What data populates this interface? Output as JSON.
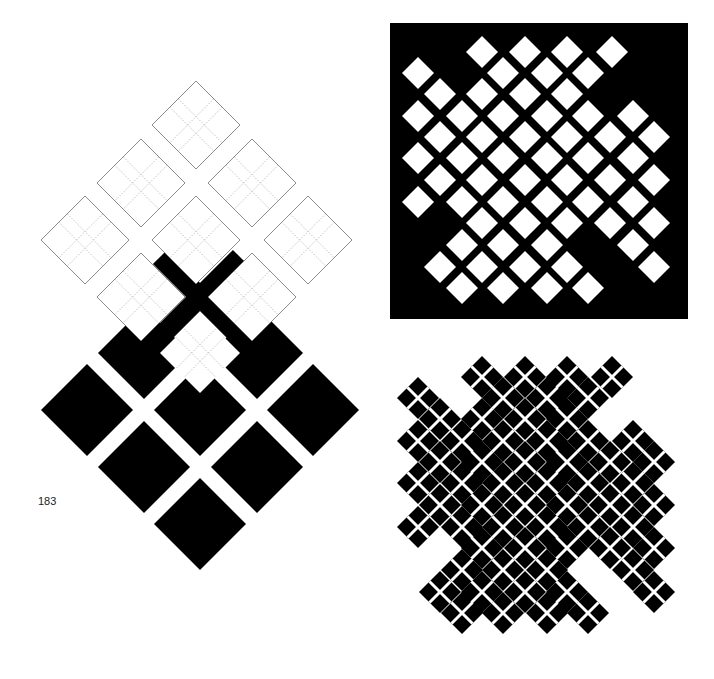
{
  "page": {
    "number": "183",
    "background": "#ffffff",
    "ink": "#000000"
  },
  "figure_left": {
    "description": "Grid of outlined diamonds with dotted inner crosses above a grid of solid black diamonds",
    "outline_diamonds": {
      "half_diagonal": 44,
      "stroke": "#6e6e6e",
      "dotted_stroke": "#9a9a9a",
      "centers": [
        [
          196,
          125
        ],
        [
          141,
          183
        ],
        [
          252,
          183
        ],
        [
          85,
          240
        ],
        [
          196,
          240
        ],
        [
          308,
          240
        ],
        [
          141,
          297
        ],
        [
          252,
          297
        ]
      ]
    },
    "center_white_diamond": {
      "center": [
        200,
        353
      ],
      "half_diagonal": 40
    },
    "black_x": {
      "center": [
        200,
        297
      ],
      "arm_half_length": 40,
      "arm_width": 20
    },
    "black_diamonds": {
      "half_diagonal": 46,
      "centers": [
        [
          144,
          353
        ],
        [
          257,
          353
        ],
        [
          87,
          410
        ],
        [
          200,
          410
        ],
        [
          313,
          410
        ],
        [
          144,
          467
        ],
        [
          257,
          467
        ],
        [
          200,
          524
        ]
      ]
    }
  },
  "figure_top_right": {
    "description": "Black square panel with lattice of white diamonds",
    "panel": {
      "x": 390,
      "y": 23,
      "width": 298,
      "height": 296,
      "fill": "#000000"
    },
    "diamond_half_diagonal": 16,
    "rows": [
      {
        "y": 52,
        "xs": [
          482,
          525,
          567,
          612
        ]
      },
      {
        "y": 73,
        "xs": [
          418,
          503,
          547,
          588
        ]
      },
      {
        "y": 94,
        "xs": [
          440,
          482,
          525,
          567
        ]
      },
      {
        "y": 116,
        "xs": [
          418,
          462,
          503,
          547,
          588,
          633
        ]
      },
      {
        "y": 137,
        "xs": [
          440,
          482,
          525,
          567,
          610,
          654
        ]
      },
      {
        "y": 158,
        "xs": [
          418,
          462,
          503,
          547,
          588,
          633
        ]
      },
      {
        "y": 180,
        "xs": [
          440,
          482,
          525,
          567,
          610,
          654
        ]
      },
      {
        "y": 202,
        "xs": [
          418,
          462,
          503,
          547,
          588,
          633
        ]
      },
      {
        "y": 223,
        "xs": [
          482,
          525,
          567,
          610,
          654
        ]
      },
      {
        "y": 245,
        "xs": [
          462,
          503,
          547,
          633
        ]
      },
      {
        "y": 267,
        "xs": [
          440,
          482,
          525,
          567,
          654
        ]
      },
      {
        "y": 288,
        "xs": [
          462,
          503,
          547,
          588
        ]
      }
    ]
  },
  "figure_bottom_right": {
    "description": "Inverse lattice: black diamonds separated by white lines, edge cells split into four small squares",
    "offset_y": 325,
    "diamond_half_diagonal": 21
  }
}
